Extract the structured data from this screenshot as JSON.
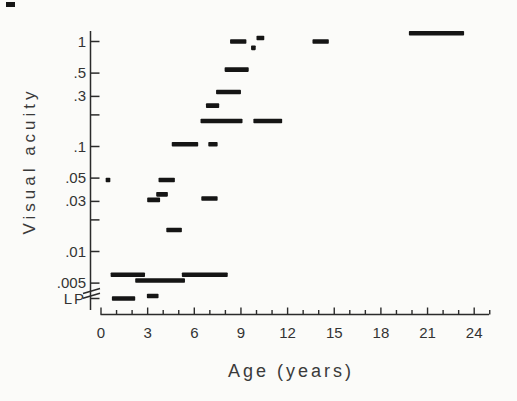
{
  "figure": {
    "background_color": "#fbfbf9",
    "scan_artifact_top_left": true
  },
  "chart_data": {
    "type": "bar",
    "orientation": "horizontal-range-marks",
    "title": "",
    "xlabel": "Age (years)",
    "ylabel": "Visual acuity",
    "x_axis": {
      "min": 0,
      "max": 25,
      "major_ticks": [
        0,
        3,
        6,
        9,
        12,
        15,
        18,
        21,
        24
      ],
      "minor_tick_step": 1
    },
    "y_axis": {
      "scale": "log",
      "top_value": 1.3,
      "ticks": [
        {
          "label": "1",
          "value": 1
        },
        {
          "label": ".5",
          "value": 0.5
        },
        {
          "label": ".3",
          "value": 0.3
        },
        {
          "label": "",
          "value": 0.2
        },
        {
          "label": ".1",
          "value": 0.1
        },
        {
          "label": ".05",
          "value": 0.05
        },
        {
          "label": ".03",
          "value": 0.03
        },
        {
          "label": "",
          "value": 0.02
        },
        {
          "label": ".01",
          "value": 0.01
        },
        {
          "label": ".005",
          "value": 0.005
        },
        {
          "label": "LP",
          "value": "LP"
        }
      ],
      "axis_break_above_lp": true
    },
    "grid": false,
    "legend": "none",
    "marks_note": "Each mark spans an age range (years) at one visual-acuity level; LP = light perception.",
    "marks": [
      {
        "age_start": 0.3,
        "age_end": 0.6,
        "acuity": 0.048
      },
      {
        "age_start": 0.62,
        "age_end": 2.83,
        "acuity": 0.006
      },
      {
        "age_start": 2.2,
        "age_end": 5.4,
        "acuity": 0.0053
      },
      {
        "age_start": 5.2,
        "age_end": 8.15,
        "acuity": 0.006
      },
      {
        "age_start": 0.7,
        "age_end": 2.2,
        "acuity": "LP"
      },
      {
        "age_start": 2.95,
        "age_end": 3.7,
        "acuity": "LP",
        "stagger_px": -2.5
      },
      {
        "age_start": 2.97,
        "age_end": 3.8,
        "acuity": 0.031
      },
      {
        "age_start": 3.55,
        "age_end": 4.3,
        "acuity": 0.035
      },
      {
        "age_start": 3.7,
        "age_end": 4.75,
        "acuity": 0.048
      },
      {
        "age_start": 4.2,
        "age_end": 5.2,
        "acuity": 0.016
      },
      {
        "age_start": 6.45,
        "age_end": 7.5,
        "acuity": 0.032
      },
      {
        "age_start": 4.55,
        "age_end": 6.25,
        "acuity": 0.105
      },
      {
        "age_start": 6.9,
        "age_end": 7.5,
        "acuity": 0.105
      },
      {
        "age_start": 6.4,
        "age_end": 9.1,
        "acuity": 0.175
      },
      {
        "age_start": 9.8,
        "age_end": 11.65,
        "acuity": 0.175
      },
      {
        "age_start": 6.75,
        "age_end": 7.6,
        "acuity": 0.245
      },
      {
        "age_start": 7.4,
        "age_end": 9.0,
        "acuity": 0.33
      },
      {
        "age_start": 7.95,
        "age_end": 9.5,
        "acuity": 0.54
      },
      {
        "age_start": 8.3,
        "age_end": 9.35,
        "acuity": 1.0
      },
      {
        "age_start": 9.65,
        "age_end": 9.95,
        "acuity": 0.87
      },
      {
        "age_start": 10.0,
        "age_end": 10.5,
        "acuity": 1.08
      },
      {
        "age_start": 13.6,
        "age_end": 14.65,
        "acuity": 1.0
      },
      {
        "age_start": 19.8,
        "age_end": 23.35,
        "acuity": 1.2
      }
    ],
    "colors": {
      "marks": "#151515",
      "axis": "#2b2b2b",
      "tick_labels": "#333333",
      "background": "#fbfbf9"
    }
  }
}
